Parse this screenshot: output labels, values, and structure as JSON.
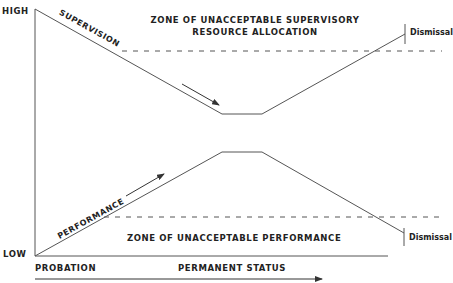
{
  "axes": {
    "y_high": "HIGH",
    "y_low": "LOW",
    "x_probation": "PROBATION",
    "x_permanent": "PERMANENT STATUS"
  },
  "curves": {
    "supervision": "SUPERVISION",
    "performance": "PERFORMANCE"
  },
  "zones": {
    "supervisory_line1": "ZONE OF UNACCEPTABLE SUPERVISORY",
    "supervisory_line2": "RESOURCE ALLOCATION",
    "performance": "ZONE OF UNACCEPTABLE PERFORMANCE"
  },
  "endpoints": {
    "top_dismissal": "Dismissal",
    "bottom_dismissal": "Dismissal"
  },
  "colors": {
    "line": "#444444",
    "text": "#222222"
  }
}
